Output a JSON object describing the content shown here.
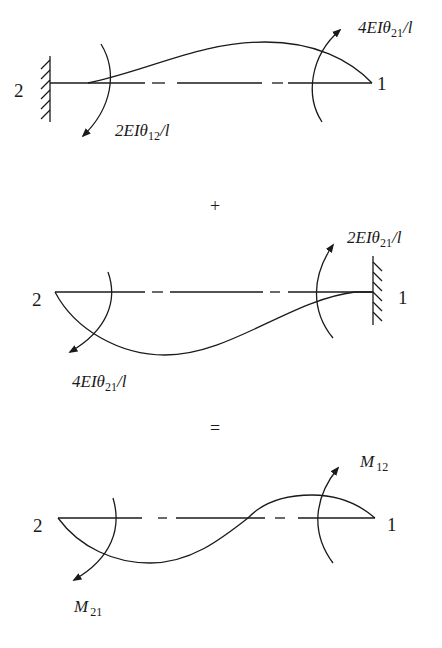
{
  "figure": {
    "panels": [
      {
        "id": "top",
        "left_node": "2",
        "right_node": "1",
        "fixed_end": "left",
        "left_moment": {
          "coef": "2",
          "body": "EIθ",
          "sub": "12",
          "tail": "/l"
        },
        "right_moment": {
          "coef": "4",
          "body": "EIθ",
          "sub": "21",
          "tail": "/l"
        }
      },
      {
        "id": "middle",
        "left_node": "2",
        "right_node": "1",
        "fixed_end": "right",
        "left_moment": {
          "coef": "4",
          "body": "EIθ",
          "sub": "21",
          "tail": "/l"
        },
        "right_moment": {
          "coef": "2",
          "body": "EIθ",
          "sub": "21",
          "tail": "/l"
        }
      },
      {
        "id": "bottom",
        "left_node": "2",
        "right_node": "1",
        "fixed_end": "none",
        "left_moment": {
          "coef": "",
          "body": "M",
          "sub": "21",
          "tail": ""
        },
        "right_moment": {
          "coef": "",
          "body": "M",
          "sub": "12",
          "tail": ""
        }
      }
    ],
    "operators": {
      "plus": "+",
      "equals": "="
    }
  }
}
